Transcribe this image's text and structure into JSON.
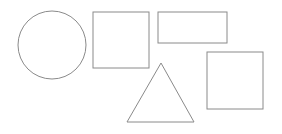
{
  "canvas": {
    "width": 282,
    "height": 134,
    "background": "#ffffff"
  },
  "style": {
    "stroke": "#8a8a8a",
    "stroke_width": 1,
    "fill": "none"
  },
  "shapes": [
    {
      "id": "circle",
      "type": "circle",
      "cx": 52,
      "cy": 45,
      "r": 34
    },
    {
      "id": "square-1",
      "type": "rect",
      "x": 93,
      "y": 12,
      "width": 56,
      "height": 56
    },
    {
      "id": "wide-rectangle",
      "type": "rect",
      "x": 158,
      "y": 12,
      "width": 69,
      "height": 31
    },
    {
      "id": "triangle",
      "type": "polygon",
      "points": "161,63 194,122 127,122"
    },
    {
      "id": "square-2",
      "type": "rect",
      "x": 207,
      "y": 52,
      "width": 56,
      "height": 57
    }
  ]
}
